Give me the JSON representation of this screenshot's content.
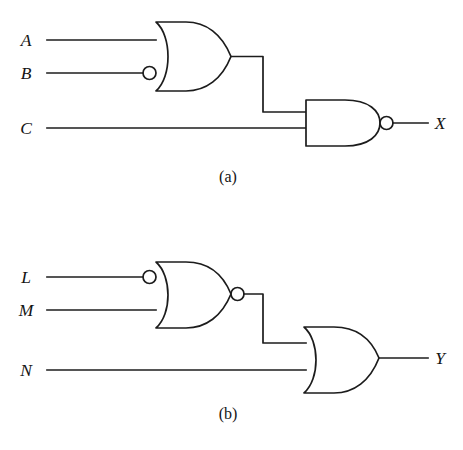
{
  "figure": {
    "background_color": "#ffffff",
    "line_color": "#1c1c1c",
    "text_color": "#141414"
  },
  "circuits": [
    {
      "id": "a",
      "caption": "(a)",
      "inputs": [
        {
          "label": "A",
          "inverted": false
        },
        {
          "label": "B",
          "inverted": true
        },
        {
          "label": "C",
          "inverted": false
        }
      ],
      "output": {
        "label": "X"
      },
      "gates": [
        {
          "type": "OR",
          "name": "or-gate-ab",
          "inputs": [
            "A",
            "B"
          ],
          "input_bubbles": [
            "B"
          ],
          "output_bubble": false
        },
        {
          "type": "NAND",
          "name": "nand-gate-x",
          "inputs": [
            "or-gate-ab",
            "C"
          ],
          "input_bubbles": [],
          "output_bubble": true
        }
      ],
      "expression": "X = NOT( (A + NOT B) . C )"
    },
    {
      "id": "b",
      "caption": "(b)",
      "inputs": [
        {
          "label": "L",
          "inverted": true
        },
        {
          "label": "M",
          "inverted": false
        },
        {
          "label": "N",
          "inverted": false
        }
      ],
      "output": {
        "label": "Y"
      },
      "gates": [
        {
          "type": "NOR",
          "name": "nor-gate-lm",
          "inputs": [
            "L",
            "M"
          ],
          "input_bubbles": [
            "L"
          ],
          "output_bubble": true
        },
        {
          "type": "OR",
          "name": "or-gate-y",
          "inputs": [
            "nor-gate-lm",
            "N"
          ],
          "input_bubbles": [],
          "output_bubble": false
        }
      ],
      "expression": "Y = NOT( NOT L + M ) + N"
    }
  ]
}
